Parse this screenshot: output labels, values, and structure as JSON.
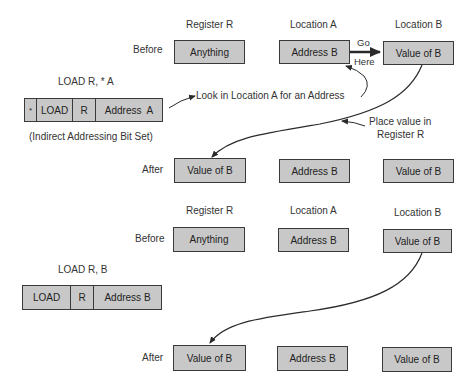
{
  "top": {
    "headers": {
      "register": "Register R",
      "locA": "Location A",
      "locB": "Location B"
    },
    "before_label": "Before",
    "after_label": "After",
    "before": {
      "register": "Anything",
      "locA": "Address B",
      "locB": "Value of B"
    },
    "after": {
      "register": "Value of B",
      "locA": "Address B",
      "locB": "Value of B"
    },
    "instruction_title": "LOAD R, * A",
    "instruction_fields": [
      "*",
      "LOAD",
      "R",
      "Address  A"
    ],
    "instruction_note": "(Indirect Addressing Bit Set)",
    "annotations": {
      "go": "Go",
      "here": "Here",
      "look": "Look in Location A  for an Address",
      "place_line1": "Place value in",
      "place_line2": "Register R"
    }
  },
  "bottom": {
    "headers": {
      "register": "Register R",
      "locA": "Location A",
      "locB": "Location B"
    },
    "before_label": "Before",
    "after_label": "After",
    "before": {
      "register": "Anything",
      "locA": "Address B",
      "locB": "Value of B"
    },
    "after": {
      "register": "Value of B",
      "locA": "Address B",
      "locB": "Value of B"
    },
    "instruction_title": "LOAD R, B",
    "instruction_fields": [
      "LOAD",
      "R",
      "Address B"
    ]
  }
}
